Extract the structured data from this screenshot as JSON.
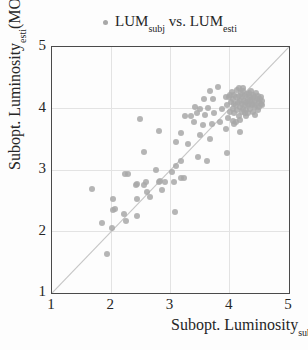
{
  "legend": {
    "marker_color": "#a8a8a8",
    "series_label": {
      "name1": "LUM",
      "sub1": "subj",
      "middle": " vs. ",
      "name2": "LUM",
      "sub2": "esti"
    }
  },
  "axes": {
    "x": {
      "label_prefix": "Subopt. Luminosity",
      "label_sub": "subj",
      "label_suffix": "(MOS)",
      "min": 1,
      "max": 5,
      "ticks": [
        "1",
        "2",
        "3",
        "4",
        "5"
      ],
      "gridlines": [
        2,
        3,
        4
      ]
    },
    "y": {
      "label_prefix": "Subopt. Luminosity",
      "label_sub": "esti",
      "label_suffix": "(MOS)",
      "min": 1,
      "max": 5,
      "ticks": [
        "1",
        "2",
        "3",
        "4",
        "5"
      ],
      "gridlines": [
        2,
        3,
        4
      ]
    }
  },
  "colors": {
    "marker": "#a8a8a8",
    "frame": "#4a4a4a",
    "grid": "#e3e3e3",
    "diagonal": "#c6c6c6",
    "background": "#fdfdfd",
    "text": "#262626"
  },
  "chart_data": {
    "type": "scatter",
    "title": "",
    "xlabel": "Subopt. Luminosity_subj(MOS)",
    "ylabel": "Subopt. Luminosity_esti(MOS)",
    "xlim": [
      1,
      5
    ],
    "ylim": [
      1,
      5
    ],
    "grid": true,
    "identity_line": true,
    "legend_position": "top-center",
    "series": [
      {
        "name": "LUM_subj vs. LUM_esti",
        "color": "#a8a8a8",
        "marker": "circle",
        "points": [
          [
            1.68,
            2.69
          ],
          [
            1.84,
            2.14
          ],
          [
            1.92,
            1.64
          ],
          [
            2.02,
            2.06
          ],
          [
            2.03,
            2.53
          ],
          [
            2.03,
            2.35
          ],
          [
            2.06,
            2.37
          ],
          [
            2.22,
            2.29
          ],
          [
            2.25,
            2.17
          ],
          [
            2.24,
            2.93
          ],
          [
            2.29,
            2.94
          ],
          [
            2.41,
            2.76
          ],
          [
            2.43,
            2.78
          ],
          [
            2.43,
            2.53
          ],
          [
            2.43,
            2.25
          ],
          [
            2.48,
            3.83
          ],
          [
            2.55,
            2.75
          ],
          [
            2.56,
            3.3
          ],
          [
            2.58,
            2.8
          ],
          [
            2.61,
            2.65
          ],
          [
            2.66,
            2.56
          ],
          [
            2.75,
            3.0
          ],
          [
            2.8,
            3.64
          ],
          [
            2.8,
            2.81
          ],
          [
            2.83,
            2.82
          ],
          [
            2.86,
            2.67
          ],
          [
            2.9,
            2.8
          ],
          [
            3.03,
            2.97
          ],
          [
            3.06,
            2.81
          ],
          [
            3.07,
            2.32
          ],
          [
            3.09,
            3.06
          ],
          [
            3.1,
            3.45
          ],
          [
            3.17,
            3.6
          ],
          [
            3.17,
            3.15
          ],
          [
            3.18,
            2.87
          ],
          [
            3.23,
            2.87
          ],
          [
            3.25,
            3.88
          ],
          [
            3.3,
            3.42
          ],
          [
            3.34,
            3.87
          ],
          [
            3.42,
            4.02
          ],
          [
            3.46,
            3.21
          ],
          [
            3.61,
            3.14
          ],
          [
            3.39,
            3.78
          ],
          [
            3.45,
            3.92
          ],
          [
            3.49,
            3.57
          ],
          [
            3.5,
            3.99
          ],
          [
            3.55,
            3.73
          ],
          [
            3.56,
            4.16
          ],
          [
            3.59,
            3.89
          ],
          [
            3.64,
            4.01
          ],
          [
            3.67,
            4.29
          ],
          [
            3.67,
            3.51
          ],
          [
            3.7,
            3.75
          ],
          [
            3.71,
            4.16
          ],
          [
            3.73,
            3.92
          ],
          [
            3.81,
            4.35
          ],
          [
            3.84,
            3.78
          ],
          [
            3.87,
            3.99
          ],
          [
            3.93,
            4.19
          ],
          [
            3.93,
            3.67
          ],
          [
            3.96,
            3.28
          ],
          [
            4.07,
            3.75
          ],
          [
            4.17,
            3.62
          ],
          [
            3.95,
            4.05
          ],
          [
            3.97,
            3.85
          ],
          [
            3.98,
            4.18
          ],
          [
            4.0,
            3.95
          ],
          [
            4.0,
            4.22
          ],
          [
            4.02,
            4.1
          ],
          [
            4.03,
            4.27
          ],
          [
            4.05,
            4.0
          ],
          [
            4.05,
            3.8
          ],
          [
            4.06,
            4.15
          ],
          [
            4.08,
            3.92
          ],
          [
            4.08,
            4.08
          ],
          [
            4.08,
            4.22
          ],
          [
            4.1,
            4.05
          ],
          [
            4.1,
            3.78
          ],
          [
            4.11,
            4.18
          ],
          [
            4.12,
            3.97
          ],
          [
            4.13,
            4.3
          ],
          [
            4.14,
            4.1
          ],
          [
            4.15,
            3.88
          ],
          [
            4.15,
            4.33
          ],
          [
            4.16,
            4.2
          ],
          [
            4.17,
            4.02
          ],
          [
            4.18,
            4.12
          ],
          [
            4.18,
            3.82
          ],
          [
            4.19,
            4.25
          ],
          [
            4.2,
            3.95
          ],
          [
            4.2,
            4.08
          ],
          [
            4.21,
            4.18
          ],
          [
            4.22,
            4.0
          ],
          [
            4.22,
            4.33
          ],
          [
            4.23,
            4.28
          ],
          [
            4.24,
            4.12
          ],
          [
            4.25,
            3.92
          ],
          [
            4.25,
            4.05
          ],
          [
            4.26,
            4.2
          ],
          [
            4.27,
            4.1
          ],
          [
            4.28,
            3.98
          ],
          [
            4.28,
            3.88
          ],
          [
            4.29,
            4.23
          ],
          [
            4.3,
            4.05
          ],
          [
            4.3,
            4.15
          ],
          [
            4.31,
            3.93
          ],
          [
            4.32,
            4.25
          ],
          [
            4.33,
            4.08
          ],
          [
            4.34,
            4.18
          ],
          [
            4.35,
            4.0
          ],
          [
            4.35,
            4.12
          ],
          [
            4.36,
            4.28
          ],
          [
            4.37,
            4.05
          ],
          [
            4.38,
            4.15
          ],
          [
            4.39,
            3.95
          ],
          [
            4.4,
            4.22
          ],
          [
            4.4,
            4.08
          ],
          [
            4.41,
            4.18
          ],
          [
            4.42,
            4.02
          ],
          [
            4.42,
            3.9
          ],
          [
            4.43,
            4.12
          ],
          [
            4.44,
            4.25
          ],
          [
            4.45,
            4.06
          ],
          [
            4.46,
            4.16
          ],
          [
            4.47,
            3.98
          ],
          [
            4.48,
            4.2
          ],
          [
            4.49,
            4.1
          ],
          [
            4.5,
            4.03
          ],
          [
            4.51,
            4.15
          ],
          [
            4.52,
            4.08
          ],
          [
            4.53,
            4.18
          ],
          [
            4.54,
            4.05
          ],
          [
            4.55,
            4.12
          ]
        ]
      }
    ]
  }
}
